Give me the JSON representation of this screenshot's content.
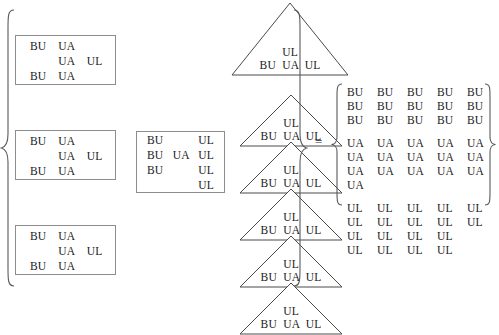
{
  "figure": {
    "equals_sign": "=",
    "ink_color": "#1a1a1a",
    "line_color": "#4a4a4a",
    "box_border_color": "#8d8d8d",
    "background": "#ffffff"
  },
  "left_group": {
    "boxes": [
      {
        "name": "left-box-1",
        "rows": [
          [
            "BU",
            "UA",
            ""
          ],
          [
            "",
            "UA",
            "UL"
          ],
          [
            "BU",
            "UA",
            ""
          ]
        ]
      },
      {
        "name": "left-box-2",
        "rows": [
          [
            "BU",
            "UA",
            ""
          ],
          [
            "",
            "UA",
            "UL"
          ],
          [
            "BU",
            "UA",
            ""
          ]
        ]
      },
      {
        "name": "left-box-3",
        "rows": [
          [
            "BU",
            "UA",
            ""
          ],
          [
            "",
            "UA",
            "UL"
          ],
          [
            "BU",
            "UA",
            ""
          ]
        ]
      }
    ]
  },
  "middle_group": {
    "boxes": [
      {
        "name": "middle-box-1",
        "rows": [
          [
            "BU",
            "",
            "UL"
          ],
          [
            "BU",
            "UA",
            "UL"
          ],
          [
            "BU",
            "",
            "UL"
          ],
          [
            "",
            "",
            "UL"
          ]
        ]
      }
    ]
  },
  "triangle_group": {
    "triangles": [
      {
        "name": "triangle-1",
        "lines": [
          "UL",
          "BU  UA  UL"
        ]
      },
      {
        "name": "triangle-2",
        "lines": [
          "UL",
          "BU  UA  UL"
        ]
      },
      {
        "name": "triangle-3",
        "lines": [
          "UL",
          "BU  UA  UL"
        ]
      },
      {
        "name": "triangle-4",
        "lines": [
          "UL",
          "BU  UA  UL"
        ]
      },
      {
        "name": "triangle-5",
        "lines": [
          "UL",
          "BU  UA  UL"
        ]
      },
      {
        "name": "triangle-6",
        "lines": [
          "UL",
          "BU  UA  UL"
        ]
      }
    ]
  },
  "matrix": {
    "blocks": [
      {
        "name": "matrix-block-bu",
        "rows": [
          [
            "BU",
            "BU",
            "BU",
            "BU",
            "BU"
          ],
          [
            "BU",
            "BU",
            "BU",
            "BU",
            "BU"
          ],
          [
            "BU",
            "BU",
            "BU",
            "BU",
            "BU"
          ]
        ]
      },
      {
        "name": "matrix-block-ua",
        "rows": [
          [
            "UA",
            "UA",
            "UA",
            "UA",
            "UA"
          ],
          [
            "UA",
            "UA",
            "UA",
            "UA",
            "UA"
          ],
          [
            "UA",
            "UA",
            "UA",
            "UA",
            "UA"
          ],
          [
            "UA",
            "",
            "",
            "",
            ""
          ]
        ]
      },
      {
        "name": "matrix-block-ul",
        "rows": [
          [
            "UL",
            "UL",
            "UL",
            "UL",
            "UL"
          ],
          [
            "UL",
            "UL",
            "UL",
            "UL",
            "UL"
          ],
          [
            "UL",
            "UL",
            "UL",
            "UL",
            ""
          ],
          [
            "UL",
            "UL",
            "UL",
            "UL",
            ""
          ]
        ]
      }
    ]
  }
}
